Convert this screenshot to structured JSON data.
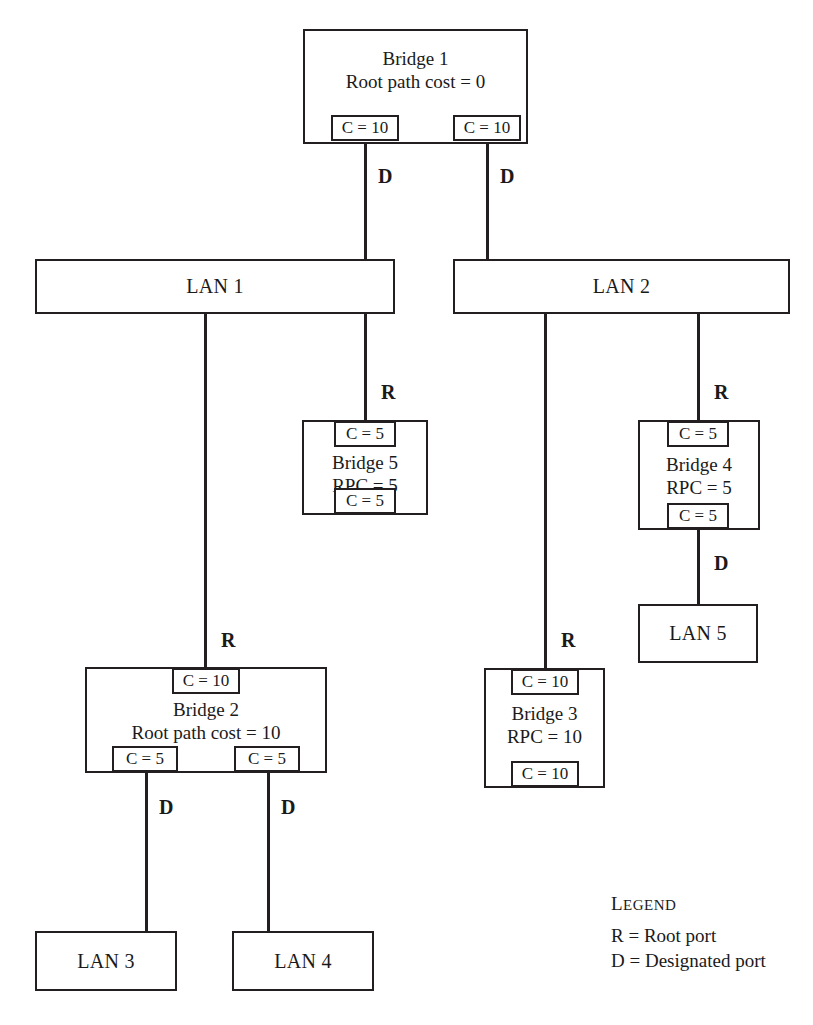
{
  "diagram": {
    "line_color": "#231f20",
    "background": "#ffffff"
  },
  "bridges": [
    {
      "id": "bridge1",
      "name": "Bridge 1",
      "cost_label": "Root path cost = 0",
      "ports": [
        {
          "label": "C = 10",
          "position": "bottom-left"
        },
        {
          "label": "C = 10",
          "position": "bottom-right"
        }
      ]
    },
    {
      "id": "bridge5",
      "name": "Bridge 5",
      "cost_label": "RPC = 5",
      "ports": [
        {
          "label": "C = 5",
          "position": "top"
        },
        {
          "label": "C = 5",
          "position": "bottom"
        }
      ]
    },
    {
      "id": "bridge4",
      "name": "Bridge 4",
      "cost_label": "RPC = 5",
      "ports": [
        {
          "label": "C = 5",
          "position": "top"
        },
        {
          "label": "C = 5",
          "position": "bottom"
        }
      ]
    },
    {
      "id": "bridge2",
      "name": "Bridge 2",
      "cost_label": "Root path cost = 10",
      "ports": [
        {
          "label": "C = 10",
          "position": "top"
        },
        {
          "label": "C = 5",
          "position": "bottom-left"
        },
        {
          "label": "C = 5",
          "position": "bottom-right"
        }
      ]
    },
    {
      "id": "bridge3",
      "name": "Bridge 3",
      "cost_label": "RPC = 10",
      "ports": [
        {
          "label": "C = 10",
          "position": "top"
        },
        {
          "label": "C = 10",
          "position": "bottom"
        }
      ]
    }
  ],
  "lans": [
    {
      "id": "lan1",
      "label": "LAN 1"
    },
    {
      "id": "lan2",
      "label": "LAN 2"
    },
    {
      "id": "lan3",
      "label": "LAN 3"
    },
    {
      "id": "lan4",
      "label": "LAN 4"
    },
    {
      "id": "lan5",
      "label": "LAN 5"
    }
  ],
  "port_roles": [
    {
      "id": "b1-left",
      "letter": "D"
    },
    {
      "id": "b1-right",
      "letter": "D"
    },
    {
      "id": "b5-top",
      "letter": "R"
    },
    {
      "id": "b4-top",
      "letter": "R"
    },
    {
      "id": "b4-bottom",
      "letter": "D"
    },
    {
      "id": "b2-top",
      "letter": "R"
    },
    {
      "id": "b2-bottom-left",
      "letter": "D"
    },
    {
      "id": "b2-bottom-right",
      "letter": "D"
    },
    {
      "id": "b3-top",
      "letter": "R"
    }
  ],
  "legend": {
    "title_first": "L",
    "title_rest": "EGEND",
    "rows": [
      "R = Root port",
      "D = Designated port"
    ]
  }
}
